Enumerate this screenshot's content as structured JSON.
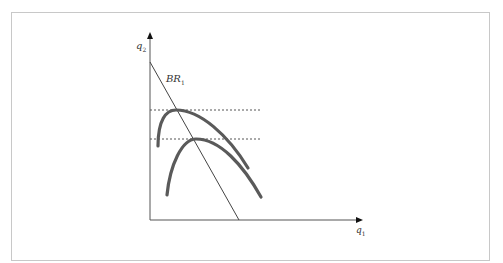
{
  "diagram": {
    "y_axis_label": "q",
    "y_axis_sub": "2",
    "x_axis_label": "q",
    "x_axis_sub": "1",
    "br_label": "BR",
    "br_sub": "1",
    "colors": {
      "axis": "#555555",
      "curve": "#5a5a5a",
      "line": "#444444",
      "dashed": "#555555",
      "frame": "#c8c8c8"
    },
    "elements": {
      "best_response_line": {
        "from": [
          150,
          62
        ],
        "to": [
          239,
          220
        ]
      },
      "dashed_levels_y": [
        110,
        139
      ],
      "upper_iso_profit_curve": {
        "start": [
          158,
          146
        ],
        "peak": [
          176,
          110
        ],
        "end": [
          248,
          168
        ]
      },
      "lower_iso_profit_curve": {
        "start": [
          167,
          195
        ],
        "peak": [
          196,
          139
        ],
        "end": [
          261,
          197
        ]
      }
    }
  }
}
